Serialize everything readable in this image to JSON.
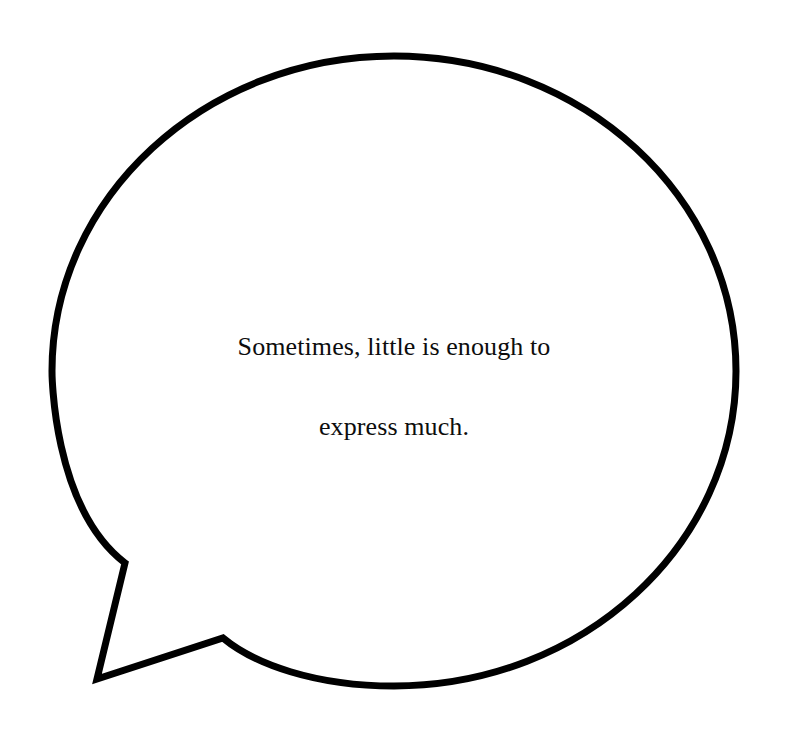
{
  "canvas": {
    "width": 788,
    "height": 737,
    "background_color": "#ffffff"
  },
  "bubble": {
    "shape_name": "speech-bubble",
    "outline_color": "#000000",
    "fill_color": "#ffffff",
    "stroke_width": 7,
    "ellipse": {
      "center_x": 394,
      "center_y": 371,
      "radius_x": 342,
      "radius_y": 315,
      "left": 48,
      "right": 740,
      "top": 53,
      "bottom": 690
    },
    "tail": {
      "name": "speech-bubble-tail",
      "direction": "down-left",
      "attach_upper_x": 125,
      "attach_upper_y": 563,
      "tip_x": 97,
      "tip_y": 679,
      "attach_lower_x": 223,
      "attach_lower_y": 638
    }
  },
  "text": {
    "full": "Sometimes, little is enough to express much.",
    "lines": [
      "Sometimes, little is enough to",
      "express much."
    ],
    "line1": "Sometimes, little is enough to",
    "line2": "express much.",
    "color": "#0d0d0d",
    "align": "center",
    "font_size_px": 26,
    "line_height_px": 40
  }
}
